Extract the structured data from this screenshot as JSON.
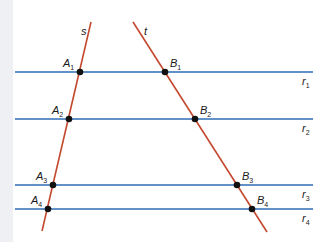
{
  "colors": {
    "parallel": "#2d6cb3",
    "transversal": "#c4482e",
    "point": "#111111",
    "background": "#ffffff",
    "strip": "#eef0f3"
  },
  "transversals": [
    {
      "name": "s",
      "label": "s",
      "x1": 91,
      "y1": 22,
      "x2": 42,
      "y2": 231,
      "label_x": 81,
      "label_y": 35
    },
    {
      "name": "t",
      "label": "t",
      "x1": 133,
      "y1": 22,
      "x2": 267,
      "y2": 232,
      "label_x": 144,
      "label_y": 35
    }
  ],
  "parallels": [
    {
      "name": "r1",
      "label": "r",
      "sub": "1",
      "y": 72,
      "x1": 15,
      "x2": 313
    },
    {
      "name": "r2",
      "label": "r",
      "sub": "2",
      "y": 119,
      "x1": 15,
      "x2": 313
    },
    {
      "name": "r3",
      "label": "r",
      "sub": "3",
      "y": 185,
      "x1": 15,
      "x2": 313
    },
    {
      "name": "r4",
      "label": "r",
      "sub": "4",
      "y": 209,
      "x1": 15,
      "x2": 313
    }
  ],
  "points": [
    {
      "name": "A1",
      "label": "A",
      "sub": "1",
      "x": 80,
      "y": 72
    },
    {
      "name": "A2",
      "label": "A",
      "sub": "2",
      "x": 69,
      "y": 119
    },
    {
      "name": "A3",
      "label": "A",
      "sub": "3",
      "x": 53,
      "y": 185
    },
    {
      "name": "A4",
      "label": "A",
      "sub": "4",
      "x": 48,
      "y": 209
    },
    {
      "name": "B1",
      "label": "B",
      "sub": "1",
      "x": 165,
      "y": 72
    },
    {
      "name": "B2",
      "label": "B",
      "sub": "2",
      "x": 195,
      "y": 119
    },
    {
      "name": "B3",
      "label": "B",
      "sub": "3",
      "x": 237,
      "y": 185
    },
    {
      "name": "B4",
      "label": "B",
      "sub": "4",
      "x": 252,
      "y": 209
    }
  ]
}
